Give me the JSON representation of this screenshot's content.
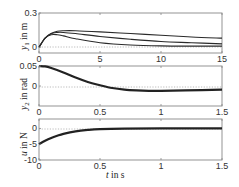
{
  "chart_data": [
    {
      "type": "line",
      "title": "",
      "xlabel": "",
      "ylabel": "y_1 in m",
      "xlim": [
        0,
        15
      ],
      "ylim": [
        -0.05,
        0.3
      ],
      "xticks": [
        "0",
        "5",
        "10",
        "15"
      ],
      "yticks": [
        "0",
        "0.3"
      ],
      "zero_line": true,
      "grid": false,
      "series": [
        {
          "name": "curve 1",
          "x": [
            0,
            0.5,
            1,
            1.5,
            2,
            3,
            5,
            7.5,
            10,
            12.5,
            15
          ],
          "values": [
            0,
            0.08,
            0.12,
            0.14,
            0.145,
            0.145,
            0.135,
            0.12,
            0.105,
            0.09,
            0.08
          ]
        },
        {
          "name": "curve 2",
          "x": [
            0,
            0.5,
            1,
            1.5,
            2,
            3,
            5,
            7.5,
            10,
            12.5,
            15
          ],
          "values": [
            0,
            0.08,
            0.12,
            0.13,
            0.13,
            0.12,
            0.095,
            0.07,
            0.05,
            0.04,
            0.03
          ]
        },
        {
          "name": "curve 3",
          "x": [
            0,
            0.5,
            1,
            1.5,
            2,
            3,
            5,
            7.5,
            10,
            12.5,
            15
          ],
          "values": [
            0,
            0.08,
            0.11,
            0.11,
            0.1,
            0.075,
            0.04,
            0.02,
            0.012,
            0.01,
            0.01
          ]
        }
      ]
    },
    {
      "type": "line",
      "title": "",
      "xlabel": "",
      "ylabel": "y_2 in rad",
      "xlim": [
        0,
        1.5
      ],
      "ylim": [
        -0.05,
        0.05
      ],
      "xticks": [
        "0",
        "0.5",
        "1",
        "1.5"
      ],
      "yticks": [
        "0",
        "0.05"
      ],
      "zero_line": true,
      "grid": false,
      "series": [
        {
          "name": "y_2",
          "x": [
            0,
            0.05,
            0.1,
            0.2,
            0.3,
            0.4,
            0.5,
            0.6,
            0.7,
            0.8,
            0.9,
            1.0,
            1.2,
            1.5
          ],
          "values": [
            0.05,
            0.049,
            0.045,
            0.034,
            0.021,
            0.01,
            0.002,
            -0.005,
            -0.009,
            -0.011,
            -0.012,
            -0.012,
            -0.011,
            -0.009
          ]
        }
      ]
    },
    {
      "type": "line",
      "title": "",
      "xlabel": "t in s",
      "ylabel": "u in N",
      "xlim": [
        0,
        1.5
      ],
      "ylim": [
        -10,
        3
      ],
      "xticks": [
        "0",
        "0.5",
        "1",
        "1.5"
      ],
      "yticks": [
        "-10",
        "-5",
        "0"
      ],
      "zero_line": true,
      "grid": false,
      "series": [
        {
          "name": "u",
          "x": [
            0,
            0.05,
            0.1,
            0.15,
            0.2,
            0.3,
            0.4,
            0.5,
            0.7,
            1.0,
            1.5
          ],
          "values": [
            -5,
            -3.9,
            -3.0,
            -2.3,
            -1.7,
            -0.9,
            -0.45,
            -0.2,
            -0.05,
            0,
            0
          ]
        }
      ]
    }
  ],
  "labels": {
    "p1_ylabel": "y",
    "p1_ysub": "1",
    "p1_yunit": " in m",
    "p2_ylabel": "y",
    "p2_ysub": "2",
    "p2_yunit": " in rad",
    "p3_ylabel": "u",
    "p3_yunit": " in N",
    "xlabel_var": "t",
    "xlabel_unit": " in s"
  }
}
